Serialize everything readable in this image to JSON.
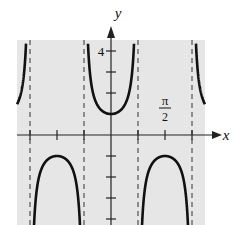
{
  "chart_data": {
    "type": "line",
    "function": "y = sec(2x)",
    "title": "",
    "xlabel": "x",
    "ylabel": "y",
    "x_tick_label": {
      "value": "π/2",
      "numerator": "π",
      "denominator": "2"
    },
    "y_tick_label": "4",
    "x_ticks": [
      "-3π/4",
      "-π/2",
      "-π/4",
      "0",
      "π/4",
      "π/2",
      "3π/4"
    ],
    "y_ticks": [
      -4,
      -3,
      -2,
      -1,
      1,
      2,
      3,
      4
    ],
    "asymptotes": [
      "-3π/4",
      "-π/4",
      "π/4",
      "3π/4"
    ],
    "xlim": [
      "-7π/8",
      "7π/8"
    ],
    "ylim": [
      -4.2,
      4.4
    ],
    "key_points": [
      {
        "x": "0",
        "y": 1,
        "kind": "local minimum"
      },
      {
        "x": "-π/2",
        "y": -1,
        "kind": "local maximum"
      },
      {
        "x": "π/2",
        "y": -1,
        "kind": "local maximum"
      }
    ],
    "grid": false,
    "background": "#e6e6e6",
    "curve_color": "#111111"
  },
  "labels": {
    "x_axis": "x",
    "y_axis": "y",
    "y_four": "4",
    "pi": "π",
    "two": "2"
  }
}
